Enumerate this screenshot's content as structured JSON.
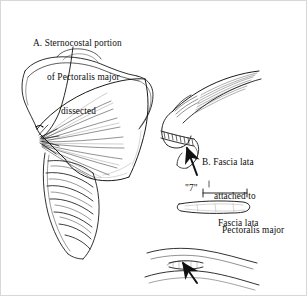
{
  "figure": {
    "kind": "surgical-line-drawing",
    "background_color": "#ffffff",
    "ink_color": "#111111",
    "border_color": "#d8d8d8",
    "width": 307,
    "height": 296
  },
  "labels": {
    "a": {
      "line1": "A. Sternocostal portion",
      "line2": "of Pectoralis major",
      "line3": "dissected"
    },
    "b": {
      "line1": "B. Fascia lata",
      "line2": "attached to",
      "line3": "Pectoralis major"
    },
    "measurement": "\"7\"",
    "graft": "Fascia lata"
  },
  "panels": [
    {
      "id": "panel-a",
      "name": "chest-pectoralis-dissection",
      "description": "Chest wall with sternocostal portion of pectoralis major dissected and reflected, ribs and costal cartilages below"
    },
    {
      "id": "panel-b",
      "name": "fascia-attached-to-pectoralis",
      "description": "Close-up of fascia lata sutured to the pectoralis major muscle belly"
    },
    {
      "id": "panel-strip",
      "name": "fascia-lata-strip",
      "description": "Harvested strip of fascia lata shown with a seven inch dimension line"
    },
    {
      "id": "panel-thigh",
      "name": "thigh-donor-site",
      "description": "Lateral thigh donor site with incision where fascia lata is harvested"
    }
  ],
  "annotations": {
    "leader_a": "leader-line-from-label-a-to-muscle-origin",
    "arrow_b": "arrow-pointing-to-fascia-graft",
    "arrow_thigh": "arrow-pointing-to-thigh-incision",
    "dimension_line": "seven-inch-dimension-line"
  }
}
